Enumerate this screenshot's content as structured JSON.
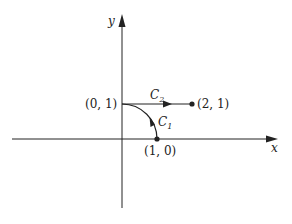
{
  "diagram": {
    "type": "coordinate-plane-path-diagram",
    "axes": {
      "x_label": "x",
      "y_label": "y"
    },
    "points": [
      {
        "id": "p01",
        "label": "(0, 1)",
        "coords": [
          0,
          1
        ]
      },
      {
        "id": "p21",
        "label": "(2, 1)",
        "coords": [
          2,
          1
        ]
      },
      {
        "id": "p10",
        "label": "(1, 0)",
        "coords": [
          1,
          0
        ]
      }
    ],
    "curves": [
      {
        "id": "C1",
        "label": "C",
        "subscript": "1",
        "description": "quarter-circle arc from (1, 0) to (0, 1)"
      },
      {
        "id": "C2",
        "label": "C",
        "subscript": "2",
        "description": "line segment from (0, 1) to (2, 1)"
      }
    ],
    "colors": {
      "stroke": "#222222",
      "background": "#ffffff"
    }
  }
}
